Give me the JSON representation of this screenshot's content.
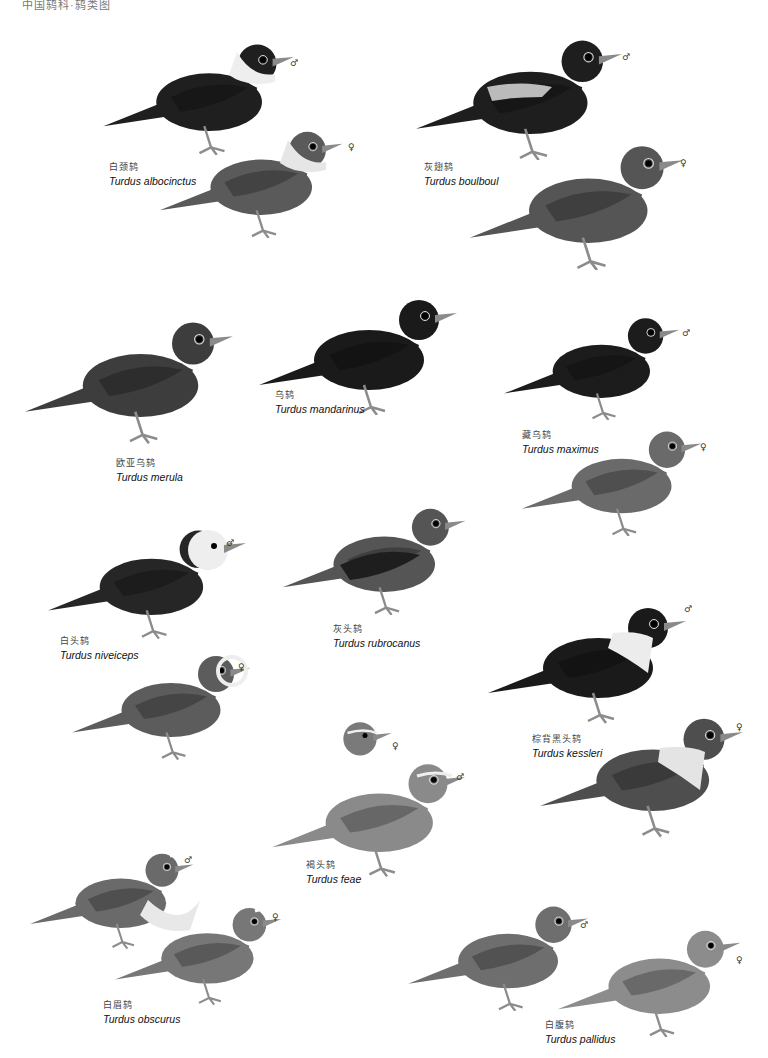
{
  "header": {
    "text": "中国鸫科·鸫类图"
  },
  "species": [
    {
      "id": "albocinctus",
      "cn": "白颈鸫",
      "sci": "Turdus albocinctus"
    },
    {
      "id": "boulboul",
      "cn": "灰翅鸫",
      "sci": "Turdus boulboul"
    },
    {
      "id": "mandarinus",
      "cn": "乌鸫",
      "sci": "Turdus mandarinus"
    },
    {
      "id": "merula",
      "cn": "欧亚乌鸫",
      "sci": "Turdus merula"
    },
    {
      "id": "maximus",
      "cn": "藏乌鸫",
      "sci": "Turdus maximus"
    },
    {
      "id": "niveiceps",
      "cn": "白头鸫",
      "sci": "Turdus niveiceps"
    },
    {
      "id": "rubrocanus",
      "cn": "灰头鸫",
      "sci": "Turdus rubrocanus"
    },
    {
      "id": "kessleri",
      "cn": "棕背黑头鸫",
      "sci": "Turdus kessleri"
    },
    {
      "id": "feae",
      "cn": "褐头鸫",
      "sci": "Turdus feae"
    },
    {
      "id": "obscurus",
      "cn": "白眉鸫",
      "sci": "Turdus obscurus"
    },
    {
      "id": "pallidus",
      "cn": "白腹鸫",
      "sci": "Turdus pallidus"
    }
  ],
  "sex_marks": {
    "male": "♂",
    "female": "♀"
  },
  "colors": {
    "black": "#1b1b1b",
    "dark": "#2e2e2e",
    "mid": "#4a4a4a",
    "grey": "#6a6a6a",
    "light": "#9a9a9a",
    "pale": "#cfcfcf",
    "white": "#f2f2f2",
    "leg": "#8c8c8c"
  }
}
